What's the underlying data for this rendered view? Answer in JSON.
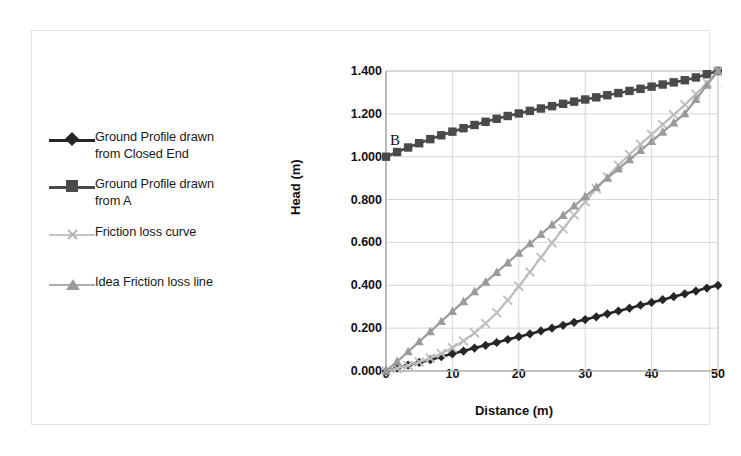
{
  "figure": {
    "border_color": "#e3e3e3",
    "background": "#ffffff"
  },
  "legend": {
    "items": [
      {
        "label_line1": "Ground Profile drawn",
        "label_line2": "from Closed End",
        "marker": "diamond-marker",
        "color": "#262626"
      },
      {
        "label_line1": "Ground Profile drawn",
        "label_line2": "from A",
        "marker": "square-marker",
        "color": "#4a4a4a"
      },
      {
        "label_line1": "Friction loss curve",
        "label_line2": "",
        "marker": "x-marker",
        "color": "#bdbdbd"
      },
      {
        "label_line1": "Idea Friction loss line",
        "label_line2": "",
        "marker": "triangle-marker",
        "color": "#9b9b9b"
      }
    ]
  },
  "annotations": {
    "point_b": "B",
    "point_a": "A"
  },
  "chart_data": {
    "type": "line",
    "title": "",
    "xlabel": "Distance (m)",
    "ylabel": "Head (m)",
    "xlim": [
      0,
      50
    ],
    "ylim": [
      0,
      1.4
    ],
    "xticks": [
      "0",
      "10",
      "20",
      "30",
      "40",
      "50"
    ],
    "xtick_values": [
      0,
      10,
      20,
      30,
      40,
      50
    ],
    "yticks": [
      "0.000",
      "0.200",
      "0.400",
      "0.600",
      "0.800",
      "1.000",
      "1.200",
      "1.400"
    ],
    "ytick_values": [
      0.0,
      0.2,
      0.4,
      0.6,
      0.8,
      1.0,
      1.2,
      1.4
    ],
    "grid": true,
    "legend_position": "left",
    "x": [
      0,
      1.67,
      3.33,
      5,
      6.67,
      8.33,
      10,
      11.67,
      13.33,
      15,
      16.67,
      18.33,
      20,
      21.67,
      23.33,
      25,
      26.67,
      28.33,
      30,
      31.67,
      33.33,
      35,
      36.67,
      38.33,
      40,
      41.67,
      43.33,
      45,
      46.67,
      48.33,
      50
    ],
    "series": [
      {
        "name": "Ground Profile drawn from Closed End",
        "marker": "diamond",
        "color": "#262626",
        "values": [
          0.0,
          0.013,
          0.027,
          0.04,
          0.053,
          0.067,
          0.08,
          0.093,
          0.107,
          0.12,
          0.133,
          0.147,
          0.16,
          0.173,
          0.187,
          0.2,
          0.213,
          0.227,
          0.24,
          0.253,
          0.267,
          0.28,
          0.293,
          0.307,
          0.32,
          0.333,
          0.347,
          0.36,
          0.373,
          0.387,
          0.4
        ]
      },
      {
        "name": "Ground Profile drawn from A",
        "marker": "square",
        "color": "#4a4a4a",
        "values": [
          1.0,
          1.022,
          1.043,
          1.063,
          1.082,
          1.1,
          1.117,
          1.133,
          1.148,
          1.163,
          1.177,
          1.19,
          1.202,
          1.214,
          1.225,
          1.236,
          1.247,
          1.257,
          1.267,
          1.277,
          1.287,
          1.297,
          1.307,
          1.317,
          1.327,
          1.337,
          1.347,
          1.357,
          1.37,
          1.385,
          1.4
        ]
      },
      {
        "name": "Friction loss curve",
        "marker": "x",
        "color": "#bdbdbd",
        "values": [
          0.0,
          0.012,
          0.026,
          0.042,
          0.06,
          0.082,
          0.108,
          0.14,
          0.178,
          0.222,
          0.272,
          0.33,
          0.395,
          0.462,
          0.53,
          0.598,
          0.664,
          0.728,
          0.79,
          0.85,
          0.906,
          0.96,
          1.01,
          1.058,
          1.104,
          1.15,
          1.196,
          1.242,
          1.292,
          1.345,
          1.4
        ]
      },
      {
        "name": "Idea Friction loss line",
        "marker": "triangle",
        "color": "#9b9b9b",
        "values": [
          0.0,
          0.044,
          0.09,
          0.137,
          0.184,
          0.231,
          0.278,
          0.324,
          0.37,
          0.415,
          0.46,
          0.505,
          0.55,
          0.594,
          0.638,
          0.682,
          0.726,
          0.77,
          0.814,
          0.857,
          0.9,
          0.943,
          0.986,
          1.029,
          1.072,
          1.115,
          1.158,
          1.201,
          1.267,
          1.334,
          1.4
        ]
      }
    ]
  }
}
